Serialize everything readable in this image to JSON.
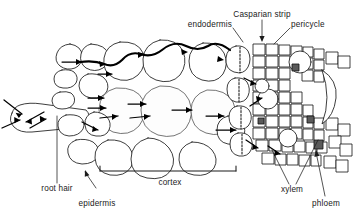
{
  "figure": {
    "background_color": "#ffffff",
    "ink_color": "#1a1a1a"
  },
  "labels": {
    "casparian_strip": "Casparian strip",
    "endodermis": "endodermis",
    "pericycle": "pericycle",
    "root_hair": "root hair",
    "epidermis": "epidermis",
    "cortex": "cortex",
    "xylem": "xylem",
    "phloem": "phloem"
  },
  "regions": [
    {
      "name": "root-hair",
      "label": "root hair"
    },
    {
      "name": "epidermis",
      "label": "epidermis"
    },
    {
      "name": "cortex",
      "label": "cortex"
    },
    {
      "name": "endodermis",
      "label": "endodermis"
    },
    {
      "name": "casparian-strip",
      "label": "Casparian strip"
    },
    {
      "name": "pericycle",
      "label": "pericycle"
    },
    {
      "name": "xylem",
      "label": "xylem"
    },
    {
      "name": "phloem",
      "label": "phloem"
    }
  ],
  "pathways": {
    "apoplast": "apoplast route along cell walls",
    "symplast": "symplast route through cell interiors"
  }
}
